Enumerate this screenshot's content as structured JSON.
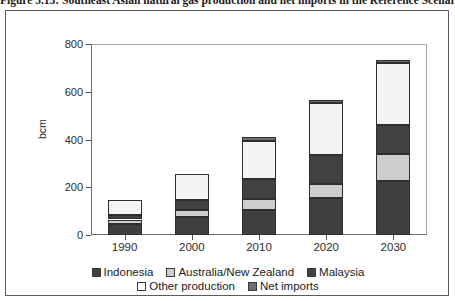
{
  "figure": {
    "title_clipped": "Figure 5.13: Southeast Asian natural gas production and net imports in the Reference Scenario"
  },
  "chart_data": {
    "type": "bar",
    "stacked": true,
    "title": "",
    "xlabel": "",
    "ylabel": "bcm",
    "categories": [
      "1990",
      "2000",
      "2010",
      "2020",
      "2030"
    ],
    "ylim": [
      0,
      800
    ],
    "yticks": [
      0,
      200,
      400,
      600,
      800
    ],
    "grid": false,
    "legend_position": "bottom",
    "series": [
      {
        "name": "Indonesia",
        "color": "#3f3f3f",
        "values": [
          48,
          75,
          105,
          155,
          225
        ]
      },
      {
        "name": "Australia/New Zealand",
        "color": "#cdcdcd",
        "values": [
          17,
          30,
          45,
          60,
          115
        ]
      },
      {
        "name": "Malaysia",
        "color": "#414141",
        "values": [
          20,
          40,
          85,
          120,
          120
        ]
      },
      {
        "name": "Other production",
        "color": "#f4f4f4",
        "values": [
          60,
          110,
          160,
          220,
          260
        ]
      },
      {
        "name": "Net imports",
        "color": "#6f6f6f",
        "values": [
          0,
          0,
          15,
          10,
          15
        ]
      }
    ],
    "totals": [
      145,
      255,
      410,
      565,
      735
    ]
  },
  "legend": {
    "rows": [
      [
        {
          "label": "Indonesia",
          "color": "#3f3f3f"
        },
        {
          "label": "Australia/New Zealand",
          "color": "#cdcdcd"
        },
        {
          "label": "Malaysia",
          "color": "#414141"
        }
      ],
      [
        {
          "label": "Other production",
          "color": "#ffffff"
        },
        {
          "label": "Net imports",
          "color": "#6f6f6f"
        }
      ]
    ]
  }
}
